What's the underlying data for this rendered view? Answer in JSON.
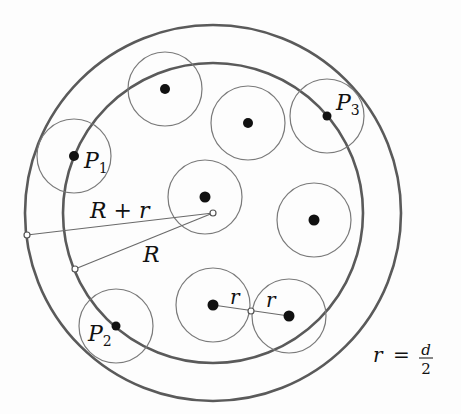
{
  "diagram": {
    "center": {
      "x": 213,
      "y": 213
    },
    "outer_circle": {
      "r": 188,
      "label": "R + r"
    },
    "inner_circle": {
      "r": 150,
      "label": "R"
    },
    "small_radius": 37,
    "particles": [
      {
        "x": 74,
        "y": 156,
        "label": "P",
        "sub": "1"
      },
      {
        "x": 165,
        "y": 89,
        "label": "",
        "sub": ""
      },
      {
        "x": 248,
        "y": 123,
        "label": "",
        "sub": ""
      },
      {
        "x": 327,
        "y": 116,
        "label": "P",
        "sub": "3"
      },
      {
        "x": 205,
        "y": 197,
        "label": "",
        "sub": ""
      },
      {
        "x": 314,
        "y": 220,
        "label": "",
        "sub": ""
      },
      {
        "x": 116,
        "y": 326,
        "label": "P",
        "sub": "2"
      },
      {
        "x": 213,
        "y": 305,
        "label": "",
        "sub": ""
      },
      {
        "x": 289,
        "y": 316,
        "label": "",
        "sub": ""
      }
    ],
    "labels": {
      "R_plus_r": "R + r",
      "R": "R",
      "P1": "P",
      "P1_sub": "1",
      "P2": "P",
      "P2_sub": "2",
      "P3": "P",
      "P3_sub": "3",
      "r_left": "r",
      "r_right": "r",
      "formula_lhs": "r",
      "formula_eq": "=",
      "formula_num": "d",
      "formula_den": "2"
    },
    "colors": {
      "stroke": "#5a5a5a",
      "dot": "#111111",
      "background": "#fdfdfd"
    }
  }
}
